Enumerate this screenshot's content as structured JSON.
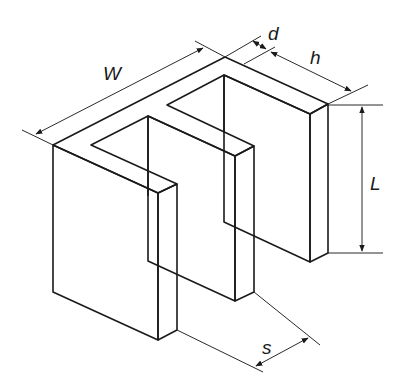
{
  "diagram": {
    "colors": {
      "face_top": "#c8c8c8",
      "face_side": "#c8c8c8",
      "face_front": "#ffffff",
      "edge": "#1a1a1a",
      "background": "#ffffff"
    },
    "dimensions": {
      "W": "W",
      "d": "d",
      "h": "h",
      "L": "L",
      "s": "s"
    },
    "components": [
      "top-plate",
      "front-left-panel",
      "middle-panel",
      "back-right-panel",
      "dimension-W",
      "dimension-d",
      "dimension-h",
      "dimension-L",
      "dimension-s"
    ]
  }
}
